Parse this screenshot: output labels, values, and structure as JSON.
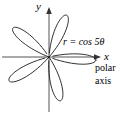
{
  "figure": {
    "background_color": "#ffffff",
    "stroke_color": "#1a1a1a",
    "axis_color": "#4d4d4d"
  },
  "labels": {
    "y_axis": "y",
    "x_axis": "x",
    "equation": "r = cos 5θ",
    "polar_line1": "polar",
    "polar_line2": "axis"
  },
  "chart_data": {
    "type": "line",
    "subtype": "polar-rose",
    "title": "r = cos 5θ",
    "equation": "r = cos 5θ",
    "coefficient_a": 1,
    "petal_parameter_n": 5,
    "petal_count": 5,
    "xlabel": "x",
    "ylabel": "y",
    "annotations": [
      "r = cos 5θ",
      "polar",
      "axis"
    ],
    "grid": false,
    "legend": false,
    "origin_px": [
      49,
      57
    ],
    "radius_px": 47,
    "theta_range_deg": [
      0,
      360
    ],
    "theta_step_deg": 1,
    "petal_axis_angles_deg": [
      0,
      72,
      144,
      216,
      288
    ],
    "petal_tip_points_px": [
      [
        96,
        57
      ],
      [
        64,
        12
      ],
      [
        11,
        29
      ],
      [
        21,
        94
      ],
      [
        72,
        100
      ]
    ],
    "axes": {
      "x_line_px": [
        [
          2,
          57
        ],
        [
          101,
          57
        ]
      ],
      "y_line_px": [
        [
          49,
          112
        ],
        [
          49,
          7
        ]
      ],
      "x_arrow_at_px": [
        101,
        57
      ],
      "y_arrow_at_px": [
        49,
        7
      ],
      "x_arrow_direction": "right",
      "y_arrow_direction": "up"
    },
    "xlim": [
      -1.05,
      1.12
    ],
    "ylim": [
      -1.18,
      1.07
    ]
  }
}
